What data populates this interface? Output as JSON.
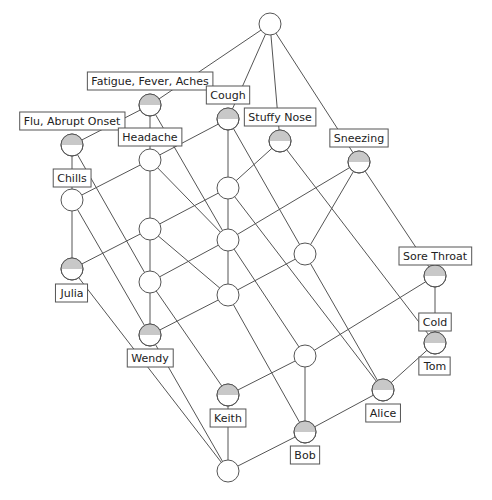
{
  "diagram": {
    "type": "concept-lattice",
    "node_radius": 11,
    "colors": {
      "line": "#555555",
      "node_fill": "#ffffff",
      "half_fill": "#c8c8c8",
      "label_border": "#555555",
      "text": "#222222"
    },
    "nodes": [
      {
        "id": "top",
        "x": 270,
        "y": 24,
        "half": false
      },
      {
        "id": "ffa",
        "x": 150,
        "y": 105,
        "half": true
      },
      {
        "id": "cough",
        "x": 228,
        "y": 119,
        "half": true
      },
      {
        "id": "stuffy",
        "x": 280,
        "y": 141,
        "half": true
      },
      {
        "id": "sneezing",
        "x": 359,
        "y": 162,
        "half": true
      },
      {
        "id": "flu",
        "x": 72,
        "y": 145,
        "half": true
      },
      {
        "id": "headache",
        "x": 150,
        "y": 160,
        "half": false
      },
      {
        "id": "chills",
        "x": 72,
        "y": 200,
        "half": false
      },
      {
        "id": "a",
        "x": 228,
        "y": 188,
        "half": false
      },
      {
        "id": "b",
        "x": 150,
        "y": 229,
        "half": false
      },
      {
        "id": "c",
        "x": 228,
        "y": 240,
        "half": false
      },
      {
        "id": "d",
        "x": 305,
        "y": 254,
        "half": false
      },
      {
        "id": "julia",
        "x": 72,
        "y": 269,
        "half": true
      },
      {
        "id": "e",
        "x": 150,
        "y": 282,
        "half": false
      },
      {
        "id": "f",
        "x": 228,
        "y": 295,
        "half": false
      },
      {
        "id": "sore",
        "x": 435,
        "y": 276,
        "half": true
      },
      {
        "id": "wendy",
        "x": 150,
        "y": 335,
        "half": true
      },
      {
        "id": "tom",
        "x": 435,
        "y": 343,
        "half": true
      },
      {
        "id": "g",
        "x": 305,
        "y": 356,
        "half": false
      },
      {
        "id": "keith",
        "x": 228,
        "y": 395,
        "half": true
      },
      {
        "id": "alice",
        "x": 383,
        "y": 390,
        "half": true
      },
      {
        "id": "bob",
        "x": 305,
        "y": 432,
        "half": true
      },
      {
        "id": "bottom",
        "x": 228,
        "y": 471,
        "half": false
      }
    ],
    "edges": [
      [
        "top",
        "ffa"
      ],
      [
        "top",
        "cough"
      ],
      [
        "top",
        "stuffy"
      ],
      [
        "top",
        "sneezing"
      ],
      [
        "ffa",
        "flu"
      ],
      [
        "ffa",
        "headache"
      ],
      [
        "ffa",
        "c"
      ],
      [
        "cough",
        "headache"
      ],
      [
        "cough",
        "a"
      ],
      [
        "cough",
        "d"
      ],
      [
        "stuffy",
        "a"
      ],
      [
        "stuffy",
        "tom"
      ],
      [
        "sneezing",
        "c"
      ],
      [
        "sneezing",
        "d"
      ],
      [
        "sneezing",
        "sore"
      ],
      [
        "flu",
        "chills"
      ],
      [
        "flu",
        "e"
      ],
      [
        "headache",
        "chills"
      ],
      [
        "headache",
        "b"
      ],
      [
        "headache",
        "c"
      ],
      [
        "chills",
        "julia"
      ],
      [
        "chills",
        "wendy"
      ],
      [
        "a",
        "b"
      ],
      [
        "a",
        "c"
      ],
      [
        "a",
        "alice"
      ],
      [
        "b",
        "julia"
      ],
      [
        "b",
        "e"
      ],
      [
        "b",
        "f"
      ],
      [
        "c",
        "e"
      ],
      [
        "c",
        "f"
      ],
      [
        "c",
        "g"
      ],
      [
        "d",
        "f"
      ],
      [
        "d",
        "alice"
      ],
      [
        "julia",
        "bottom"
      ],
      [
        "e",
        "wendy"
      ],
      [
        "e",
        "keith"
      ],
      [
        "f",
        "wendy"
      ],
      [
        "f",
        "bob"
      ],
      [
        "sore",
        "g"
      ],
      [
        "sore",
        "tom"
      ],
      [
        "g",
        "keith"
      ],
      [
        "g",
        "bob"
      ],
      [
        "tom",
        "alice"
      ],
      [
        "wendy",
        "bottom"
      ],
      [
        "keith",
        "bottom"
      ],
      [
        "alice",
        "bob"
      ],
      [
        "bob",
        "bottom"
      ]
    ],
    "labels": [
      {
        "text": "Fatigue, Fever, Aches",
        "x": 150,
        "y": 81
      },
      {
        "text": "Cough",
        "x": 228,
        "y": 95
      },
      {
        "text": "Stuffy Nose",
        "x": 280,
        "y": 117
      },
      {
        "text": "Sneezing",
        "x": 359,
        "y": 138
      },
      {
        "text": "Flu, Abrupt Onset",
        "x": 72,
        "y": 121
      },
      {
        "text": "Headache",
        "x": 150,
        "y": 137
      },
      {
        "text": "Chills",
        "x": 72,
        "y": 178
      },
      {
        "text": "Julia",
        "x": 72,
        "y": 293
      },
      {
        "text": "Sore Throat",
        "x": 435,
        "y": 256
      },
      {
        "text": "Wendy",
        "x": 150,
        "y": 358
      },
      {
        "text": "Cold",
        "x": 435,
        "y": 322
      },
      {
        "text": "Tom",
        "x": 435,
        "y": 366
      },
      {
        "text": "Keith",
        "x": 228,
        "y": 418
      },
      {
        "text": "Alice",
        "x": 383,
        "y": 413
      },
      {
        "text": "Bob",
        "x": 305,
        "y": 455
      }
    ]
  }
}
